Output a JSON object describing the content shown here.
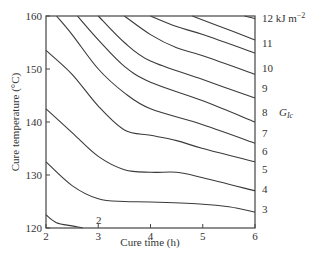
{
  "chart_data": {
    "type": "line",
    "subtype": "contour",
    "title": "",
    "xlabel": "Cure time (h)",
    "ylabel": "Cure temperature (°C)",
    "xlim": [
      2,
      6
    ],
    "ylim": [
      120,
      160
    ],
    "x_ticks": [
      "2",
      "3",
      "4",
      "5",
      "6"
    ],
    "y_ticks": [
      "120",
      "130",
      "140",
      "150",
      "160"
    ],
    "grid": false,
    "legend": null,
    "contour_variable": "G_Ic",
    "contour_unit": "kJ m^-2",
    "annotations": {
      "unit_label": "12 kJ m",
      "unit_exponent": "−2",
      "variable_label": "G",
      "variable_subscript": "Ic",
      "low_level_label": "2"
    },
    "series": [
      {
        "name": "2",
        "x": [
          2.0,
          2.2,
          2.5,
          2.7
        ],
        "y": [
          122.5,
          121.0,
          120.4,
          120.0
        ]
      },
      {
        "name": "3",
        "x": [
          2.0,
          2.5,
          3.0,
          3.5,
          4.0,
          5.0,
          5.5,
          6.0
        ],
        "y": [
          132.5,
          128.0,
          125.5,
          125.0,
          124.9,
          124.5,
          124.0,
          123.0
        ]
      },
      {
        "name": "4",
        "x": [
          2.0,
          2.5,
          3.0,
          3.5,
          4.0,
          4.5,
          5.0,
          6.0
        ],
        "y": [
          142.5,
          138.0,
          133.5,
          131.0,
          130.5,
          130.5,
          129.5,
          127.0
        ]
      },
      {
        "name": "5",
        "x": [
          2.0,
          2.5,
          3.0,
          3.5,
          4.0,
          4.5,
          5.0,
          6.0
        ],
        "y": [
          153.5,
          149.0,
          143.0,
          138.5,
          137.5,
          136.5,
          135.0,
          132.5
        ]
      },
      {
        "name": "6",
        "x": [
          2.2,
          2.5,
          3.0,
          3.5,
          4.0,
          5.0,
          6.0
        ],
        "y": [
          160.0,
          156.5,
          150.0,
          145.5,
          142.5,
          139.5,
          136.0
        ]
      },
      {
        "name": "7",
        "x": [
          2.6,
          3.0,
          3.5,
          4.0,
          5.0,
          6.0
        ],
        "y": [
          160.0,
          155.5,
          150.5,
          147.5,
          144.0,
          140.0
        ]
      },
      {
        "name": "8",
        "x": [
          3.0,
          3.5,
          4.0,
          5.0,
          6.0
        ],
        "y": [
          160.0,
          155.0,
          151.5,
          148.0,
          144.5
        ]
      },
      {
        "name": "9",
        "x": [
          3.5,
          4.0,
          4.5,
          5.0,
          6.0
        ],
        "y": [
          160.0,
          156.5,
          154.0,
          152.5,
          149.0
        ]
      },
      {
        "name": "10",
        "x": [
          4.0,
          4.5,
          5.0,
          6.0
        ],
        "y": [
          160.0,
          158.0,
          156.5,
          153.0
        ]
      },
      {
        "name": "11",
        "x": [
          4.8,
          5.2,
          6.0
        ],
        "y": [
          160.0,
          158.5,
          155.5
        ]
      },
      {
        "name": "12",
        "x": [
          5.8,
          6.0
        ],
        "y": [
          160.0,
          159.5
        ]
      }
    ],
    "right_labels": [
      {
        "label": "12 kJ m⁻²",
        "y": 159.5
      },
      {
        "label": "11",
        "y": 155.5
      },
      {
        "label": "10",
        "y": 153.0
      },
      {
        "label": "9",
        "y": 149.0
      },
      {
        "label": "8",
        "y": 144.5
      },
      {
        "label": "7",
        "y": 140.0
      },
      {
        "label": "6",
        "y": 136.0
      },
      {
        "label": "5",
        "y": 132.5
      },
      {
        "label": "4",
        "y": 127.0
      },
      {
        "label": "3",
        "y": 123.0
      }
    ]
  }
}
